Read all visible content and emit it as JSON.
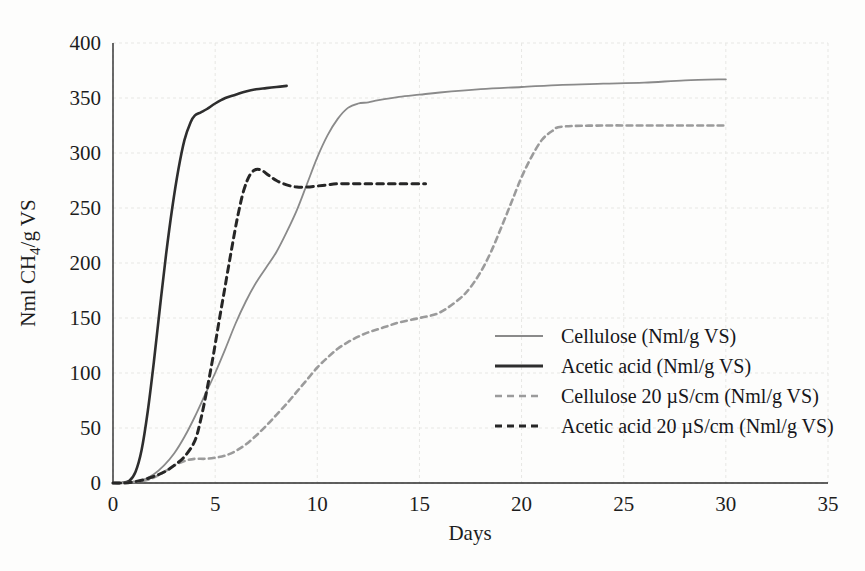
{
  "chart_data": {
    "type": "line",
    "title": "",
    "xlabel": "Days",
    "ylabel": "Nml CH₄/g VS",
    "xlim": [
      0,
      35
    ],
    "ylim": [
      0,
      400
    ],
    "xticks": [
      0,
      5,
      10,
      15,
      20,
      25,
      30,
      35
    ],
    "yticks": [
      0,
      50,
      100,
      150,
      200,
      250,
      300,
      350,
      400
    ],
    "grid": true,
    "legend_position": "center-right-inside",
    "series": [
      {
        "name": "Cellulose (Nml/g VS)",
        "style": "solid",
        "color": "#8a8a8a",
        "width": 1.8,
        "x": [
          0,
          0.5,
          1,
          1.5,
          2,
          2.5,
          3,
          3.5,
          4,
          4.5,
          5,
          5.5,
          6,
          6.5,
          7,
          7.5,
          8,
          8.5,
          9,
          9.5,
          10,
          10.5,
          11,
          11.5,
          12,
          12.5,
          13,
          14,
          15,
          16,
          18,
          20,
          22,
          24,
          26,
          28,
          30
        ],
        "y": [
          0,
          0,
          1,
          3,
          8,
          16,
          27,
          42,
          60,
          80,
          100,
          122,
          145,
          165,
          182,
          196,
          210,
          228,
          248,
          272,
          296,
          316,
          331,
          341,
          345,
          346,
          348,
          351,
          353,
          355,
          358,
          360,
          362,
          363,
          364,
          366,
          367
        ]
      },
      {
        "name": "Acetic acid (Nml/g VS)",
        "style": "solid",
        "color": "#2e2e2e",
        "width": 2.6,
        "x": [
          0,
          0.4,
          0.8,
          1.1,
          1.4,
          1.7,
          2,
          2.3,
          2.6,
          2.9,
          3.2,
          3.5,
          3.8,
          4,
          4.3,
          4.6,
          5,
          5.5,
          6,
          6.5,
          7,
          7.5,
          8,
          8.5
        ],
        "y": [
          0,
          0,
          2,
          10,
          30,
          65,
          110,
          160,
          208,
          250,
          285,
          312,
          328,
          334,
          337,
          340,
          345,
          350,
          353,
          356,
          358,
          359,
          360,
          361
        ]
      },
      {
        "name": "Cellulose 20 µS/cm (Nml/g VS)",
        "style": "dashed",
        "color": "#9b9b9b",
        "width": 2.6,
        "x": [
          0,
          0.5,
          1,
          1.5,
          2,
          2.5,
          3,
          3.5,
          4,
          4.5,
          5,
          5.5,
          6,
          6.5,
          7,
          7.5,
          8,
          8.5,
          9,
          9.5,
          10,
          10.5,
          11,
          11.5,
          12,
          12.5,
          13,
          13.5,
          14,
          15,
          16,
          17,
          17.5,
          18,
          18.5,
          19,
          19.5,
          20,
          20.5,
          21,
          21.5,
          22,
          24,
          26,
          28,
          30
        ],
        "y": [
          0,
          0,
          1,
          2,
          5,
          10,
          16,
          20,
          22,
          22,
          23,
          25,
          29,
          35,
          43,
          52,
          62,
          72,
          83,
          94,
          105,
          114,
          122,
          128,
          133,
          137,
          140,
          143,
          146,
          150,
          155,
          168,
          178,
          192,
          210,
          232,
          255,
          278,
          297,
          312,
          320,
          324,
          325,
          325,
          325,
          325
        ]
      },
      {
        "name": "Acetic acid 20 µS/cm (Nml/g VS)",
        "style": "dashed",
        "color": "#262626",
        "width": 3.0,
        "x": [
          0,
          0.5,
          1,
          1.5,
          2,
          2.5,
          3,
          3.5,
          4,
          4.3,
          4.6,
          4.9,
          5.2,
          5.5,
          5.8,
          6.1,
          6.4,
          6.7,
          7,
          7.3,
          7.6,
          8,
          8.5,
          9,
          9.5,
          10,
          10.5,
          11,
          12,
          13,
          14,
          15,
          15.3
        ],
        "y": [
          0,
          0,
          1,
          3,
          6,
          10,
          16,
          24,
          38,
          58,
          85,
          115,
          148,
          180,
          212,
          242,
          266,
          280,
          285,
          284,
          280,
          275,
          271,
          269,
          269,
          270,
          271,
          272,
          272,
          272,
          272,
          272,
          272
        ]
      }
    ]
  },
  "legend": {
    "entries": [
      {
        "label": "Cellulose (Nml/g VS)",
        "style": "solid",
        "color": "#8a8a8a",
        "width": 1.8
      },
      {
        "label": "Acetic acid (Nml/g VS)",
        "style": "solid",
        "color": "#2e2e2e",
        "width": 3.0
      },
      {
        "label": "Cellulose 20 µS/cm (Nml/g VS)",
        "style": "dashed",
        "color": "#9b9b9b",
        "width": 2.6
      },
      {
        "label": "Acetic acid 20 µS/cm (Nml/g VS)",
        "style": "dashed",
        "color": "#262626",
        "width": 3.0
      }
    ]
  },
  "axes": {
    "x_title": "Days",
    "y_title": "Nml CH₄/g VS",
    "x_tick_labels": [
      "0",
      "5",
      "10",
      "15",
      "20",
      "25",
      "30",
      "35"
    ],
    "y_tick_labels": [
      "0",
      "50",
      "100",
      "150",
      "200",
      "250",
      "300",
      "350",
      "400"
    ]
  },
  "colors": {
    "background": "#fdfdfc",
    "grid": "#e7e7e4",
    "axis": "#2b2b2b",
    "text": "#1d1d1d"
  }
}
